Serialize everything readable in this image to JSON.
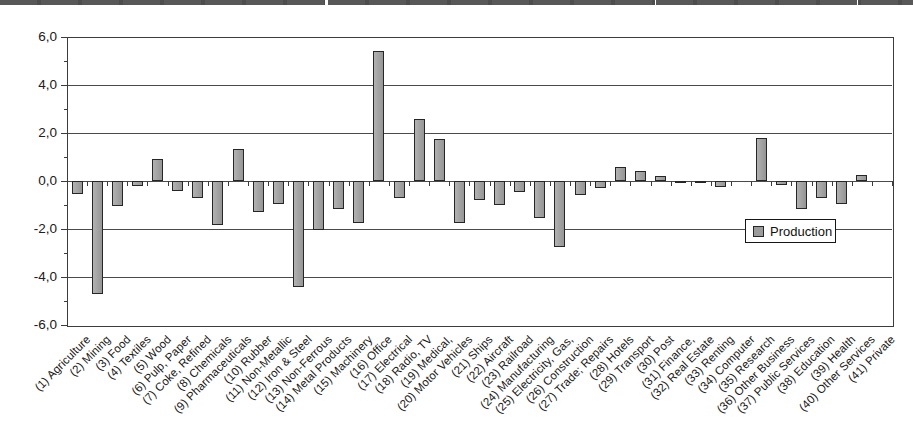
{
  "chart_data": {
    "type": "bar",
    "title": "",
    "legend": {
      "label": "Production",
      "position": "middle-right"
    },
    "ylim": [
      -6,
      6
    ],
    "ytick_interval": 2,
    "ytick_labels": [
      "6,0",
      "4,0",
      "2,0",
      "0,0",
      "-2,0",
      "-4,0",
      "-6,0"
    ],
    "decimal_separator": "comma",
    "grid": true,
    "x_labels_rotation_deg": 45,
    "bar_fill_color": "#a5a5a5",
    "bar_border_color": "#262626",
    "categories": [
      "(1) Agriculture",
      "(2) Mining",
      "(3) Food",
      "(4) Textiles",
      "(5) Wood",
      "(6) Pulp, Paper",
      "(7) Coke, Refined",
      "(8) Chemicals",
      "(9) Pharmaceuticals",
      "(10) Rubber",
      "(11) Non-Metallic",
      "(12) Iron & Steel",
      "(13) Non-Ferrous",
      "(14) Metal Products",
      "(15) Machinery",
      "(16) Office",
      "(17) Electrical",
      "(18) Radio, TV",
      "(19) Medical,",
      "(20) Motor Vehicles",
      "(21) Ships",
      "(22) Aircraft",
      "(23) Railroad",
      "(24) Manufacturing",
      "(25) Electricity, Gas,",
      "(26) Construction",
      "(27) Trade; Repairs",
      "(28) Hotels",
      "(29) Transport",
      "(30) Post",
      "(31) Finance,",
      "(32) Real Estate",
      "(33) Renting",
      "(34) Computer",
      "(35) Research",
      "(36) Other Business",
      "(37) Public Services",
      "(38) Education",
      "(39) Health",
      "(40) Other Services",
      "(41) Private"
    ],
    "values": [
      -0.55,
      -4.7,
      -1.05,
      -0.2,
      0.9,
      -0.4,
      -0.7,
      -1.85,
      1.35,
      -1.3,
      -0.95,
      -4.4,
      -2.05,
      -1.15,
      -1.75,
      5.4,
      -0.7,
      2.6,
      1.75,
      -1.75,
      -0.8,
      -1.0,
      -0.45,
      -1.55,
      -2.75,
      -0.6,
      -0.3,
      0.6,
      0.4,
      0.2,
      -0.1,
      -0.05,
      -0.25,
      0.0,
      1.8,
      -0.15,
      -1.15,
      -0.7,
      -0.95,
      0.25,
      0.0
    ]
  }
}
